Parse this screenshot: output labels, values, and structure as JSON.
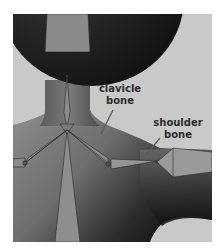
{
  "figure": {
    "labels": {
      "clavicle": [
        "clavicle",
        "bone"
      ],
      "shoulder": [
        "shoulder",
        "bone"
      ]
    },
    "colors": {
      "background": "#c8c8c8",
      "head": "#1e1e1e",
      "body_light": "#8a8a8a",
      "body_dark": "#1a1a1a",
      "bone_fill": "#8f8f8f",
      "bone_stroke": "#2a2a2a",
      "leader_line": "#5a5a5a"
    }
  }
}
